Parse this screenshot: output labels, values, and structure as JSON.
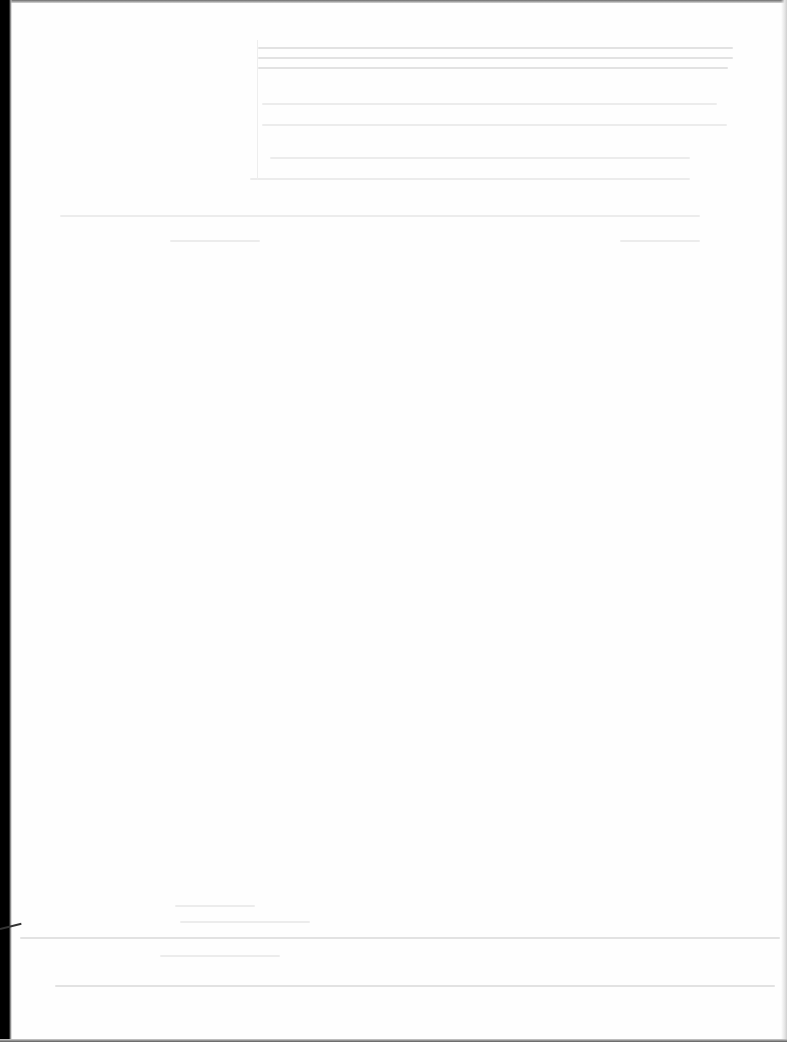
{
  "document": {
    "type": "blank scanned page",
    "legible_text": []
  },
  "colors": {
    "page": "#fefefe",
    "show_through": "#e6e6e6",
    "scan_edge": "#000000"
  }
}
